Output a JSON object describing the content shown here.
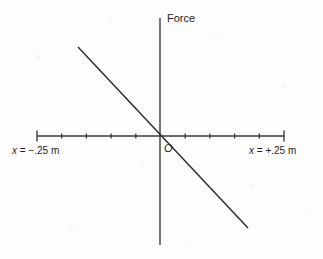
{
  "figure": {
    "width": 323,
    "height": 259,
    "background_color": "#fdfdfd",
    "stroke_color": "#3a3a3a",
    "text_color": "#1f1f1f"
  },
  "labels": {
    "vertical_axis_title": "Force",
    "origin": "O",
    "left_axis_var": "x",
    "left_axis_rest": " = −.25 m",
    "left_axis_full": "x = −.25 m",
    "right_axis_var": "x",
    "right_axis_rest": " = +.25 m",
    "right_axis_full": "x = +.25 m"
  },
  "chart_data": {
    "type": "line",
    "title": "",
    "xlabel": "x (m)",
    "ylabel": "Force",
    "grid": false,
    "legend": null,
    "axes": {
      "origin_px": {
        "x": 160,
        "y": 136
      },
      "x_axis": {
        "px_start": 37,
        "px_end": 284,
        "px_y": 136,
        "data_min": -0.25,
        "data_max": 0.25,
        "tick_count": 11,
        "tick_spacing_px": 24.7,
        "tick_values": [
          -0.25,
          -0.2,
          -0.15,
          -0.1,
          -0.05,
          0,
          0.05,
          0.1,
          0.15,
          0.2,
          0.25
        ],
        "tick_positions_px": [
          37,
          61.7,
          86.4,
          111.1,
          135.8,
          160.5,
          185.2,
          209.9,
          234.6,
          259.3,
          284
        ],
        "tick_len_short": 5,
        "tick_len_end": 11,
        "end_ticks_px": [
          37,
          284
        ],
        "labeled_ticks": [
          "x = −.25 m",
          "x = +.25 m"
        ]
      },
      "y_axis": {
        "px_x": 160,
        "px_top": 18,
        "px_bottom": 245,
        "ticks": [],
        "tick_labels": []
      }
    },
    "series": [
      {
        "name": "Force vs position",
        "type": "line",
        "description": "Straight line of negative slope passing through the origin",
        "px_start": {
          "x": 78,
          "y": 47
        },
        "px_end": {
          "x": 248,
          "y": 228
        },
        "x": [
          -0.166,
          0.178
        ],
        "values": [
          1.0,
          -1.0
        ],
        "slope_sign": "negative",
        "passes_through_origin": true
      }
    ]
  }
}
